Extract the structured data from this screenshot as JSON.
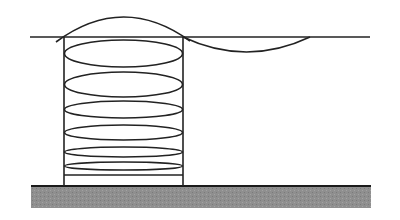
{
  "diagram": {
    "colors": {
      "background": "#ffffff",
      "stroke": "#222222",
      "ground_fill": "#8c8c8c",
      "ground_edge": "#1a1a1a"
    },
    "ground": {
      "x": 31,
      "y": 186,
      "width": 340,
      "height": 22
    },
    "water_line": {
      "x1": 30,
      "y1": 37,
      "x2": 370,
      "y2": 37
    },
    "cylinder": {
      "left_x": 64,
      "right_x": 183,
      "top_y": 37,
      "bottom_y": 186
    },
    "top_arc": {
      "x1": 56,
      "y1": 42,
      "peak_y": 17,
      "x2": 190,
      "y2": 41
    },
    "sag_arc": {
      "x1": 183,
      "y1": 37,
      "low_y": 52,
      "x2": 310,
      "y2": 37
    },
    "coils": [
      {
        "cy": 53.5,
        "ry": 13.5
      },
      {
        "cy": 84.5,
        "ry": 12.5
      },
      {
        "cy": 109.5,
        "ry": 8.5
      },
      {
        "cy": 132.5,
        "ry": 7.5
      },
      {
        "cy": 152,
        "ry": 5
      },
      {
        "cy": 166,
        "ry": 4
      }
    ],
    "bottom_ring_line_y": 175
  }
}
